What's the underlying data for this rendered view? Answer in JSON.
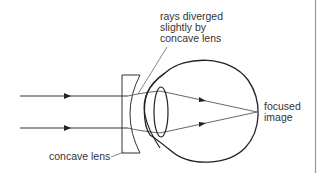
{
  "diagram": {
    "labels": {
      "diverged_line1": "rays diverged",
      "diverged_line2": "slightly by",
      "diverged_line3": "concave lens",
      "focused_line1": "focused",
      "focused_line2": "image",
      "concave_lens": "concave lens"
    },
    "colors": {
      "line": "#222222",
      "ray": "#555555",
      "text": "#333333",
      "border": "#888888"
    }
  }
}
